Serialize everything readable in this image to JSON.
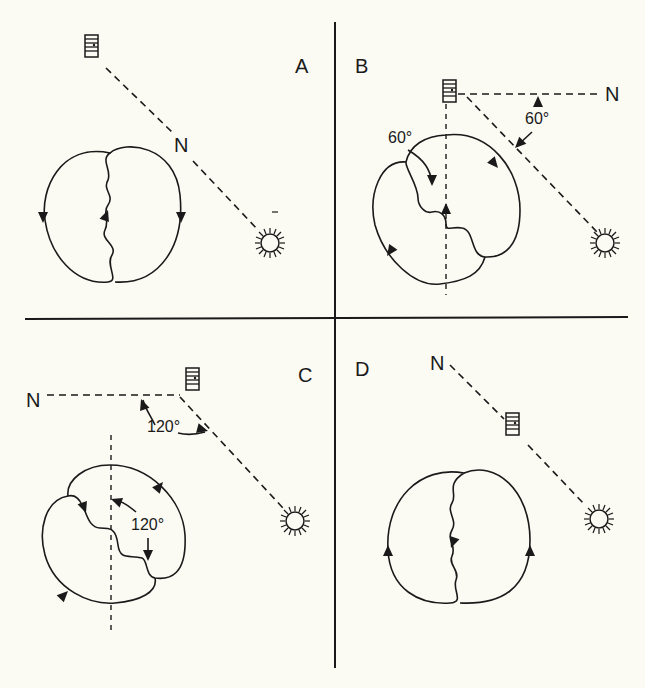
{
  "figure": {
    "background": "#fbfaf3",
    "ink": "#1a1a1a",
    "panels": [
      {
        "id": "A",
        "label": "A",
        "north_label": "N",
        "angle_labels": []
      },
      {
        "id": "B",
        "label": "B",
        "north_label": "N",
        "angle_labels": [
          "60°",
          "60°"
        ]
      },
      {
        "id": "C",
        "label": "C",
        "north_label": "N",
        "angle_labels": [
          "120°",
          "120°"
        ]
      },
      {
        "id": "D",
        "label": "D",
        "north_label": "N",
        "angle_labels": []
      }
    ],
    "icons": {
      "hive": "hive-icon",
      "sun": "sun-icon",
      "arrow": "arrowhead-icon"
    }
  }
}
